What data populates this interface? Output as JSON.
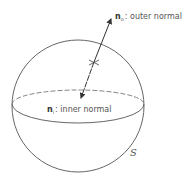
{
  "diagram": {
    "type": "sphere-normals",
    "surface_label": "S",
    "outer_normal": {
      "symbol": "n",
      "subscript": "o",
      "text": ": outer normal"
    },
    "inner_normal": {
      "symbol": "n",
      "subscript": "i",
      "text": ": inner normal"
    },
    "colors": {
      "stroke": "#555555",
      "text": "#555555",
      "background": "#ffffff"
    }
  }
}
